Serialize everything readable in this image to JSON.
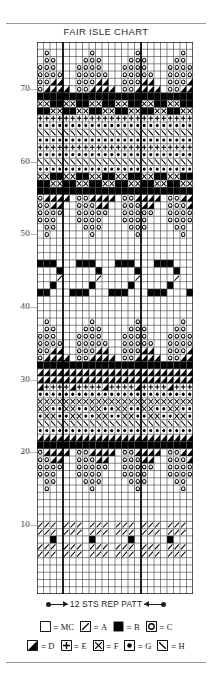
{
  "chart_title": "FAIR ISLE CHART",
  "repeat": {
    "label": "12 STS REP PATT",
    "stitches": 12,
    "marker_columns": [
      4,
      16
    ]
  },
  "grid": {
    "columns": 24,
    "rows": 76,
    "row_labels": [
      "10",
      "20",
      "30",
      "40",
      "50",
      "60",
      "70"
    ],
    "row_label_rows": [
      10,
      20,
      30,
      40,
      50,
      60,
      70
    ]
  },
  "legend": {
    "row1": [
      {
        "symbol": "blank",
        "label": "MC"
      },
      {
        "symbol": "slash",
        "label": "A"
      },
      {
        "symbol": "filled",
        "label": "B"
      },
      {
        "symbol": "circle",
        "label": "C"
      }
    ],
    "row2": [
      {
        "symbol": "halftri",
        "label": "D"
      },
      {
        "symbol": "plus",
        "label": "E"
      },
      {
        "symbol": "cross",
        "label": "F"
      },
      {
        "symbol": "dot",
        "label": "G"
      },
      {
        "symbol": "backslash",
        "label": "H"
      }
    ],
    "equals": "="
  },
  "colors": {
    "ink": "#000000",
    "grid_line": "#444444",
    "rule": "#9a9a9a",
    "text": "#2b2b2b"
  },
  "chart_data": {
    "type": "heatmap",
    "title": "FAIR ISLE CHART",
    "xlabel": "",
    "ylabel": "",
    "symbol_key": {
      "0": "MC (blank)",
      "1": "A (slash)",
      "2": "B (filled)",
      "3": "C (circle)",
      "4": "D (half triangle)",
      "5": "E (plus)",
      "6": "F (cross)",
      "7": "G (dot)",
      "8": "H (backslash)"
    },
    "columns": 24,
    "rows": 76,
    "note": "Rows listed top (row 76) to bottom (row 1); each string is 24 cells of symbol codes.",
    "matrix": [
      "000000000000000000000000",
      "030000003000000300000030",
      "033000033300003330000330",
      "333000333300033330003333",
      "333300333330033333003333",
      "334400333440033344003334",
      "344440334444033444403344",
      "222222222222222222222222",
      "662266226622662266226622",
      "226622662266226622662266",
      "555555555555555555555555",
      "777777777777777777777777",
      "888888888888888888888888",
      "777777777777777777777777",
      "555555555555555555555555",
      "777777777777777777777777",
      "888888888888888888888888",
      "777777777777777777777777",
      "662266226622662266226622",
      "226622662266226622662266",
      "222222222222222222222222",
      "344440334444033444403344",
      "334400333440033344003334",
      "333300333330033333003333",
      "333000333300033330003333",
      "033000033300003330000330",
      "030000003000000300000030",
      "000000000000000000000000",
      "000000000000000000000000",
      "000000000000000000000000",
      "222000222000222000222000",
      "000200000200000200000200",
      "000100000100000100000100",
      "002000002000002000002000",
      "220002220002220002220002",
      "000000000000000000000000",
      "000000000000000000000000",
      "000000000000000000000000",
      "030000003000000300000030",
      "033000033300003330000330",
      "333000333300033330003333",
      "333300333330033333003333",
      "334400333440033344003334",
      "344440334444033444403344",
      "222222222222222222222222",
      "444444444444444444444444",
      "444444444444444444444444",
      "455554555545555455554555",
      "777777777777777777777777",
      "666666666666666666666666",
      "667766776677667766776677",
      "766776677667766776677667",
      "888888888888888888888888",
      "777777777777777777777777",
      "444444444444444444444444",
      "222222222222222222222222",
      "344440334444033444403344",
      "334400333440033344003334",
      "333300333330033333003333",
      "333000333300033330003333",
      "033000033300003330000330",
      "030000003000000300000030",
      "000000000000000000000000",
      "000000000000000000000000",
      "000000000000000000000000",
      "000000000000000000000000",
      "111011101110111011101110",
      "111011101110111011101110",
      "002000002000002000002000",
      "111011101110111011101110",
      "111011101110111011101110",
      "000000000000000000000000",
      "000000000000000000000000",
      "000000000000000000000000",
      "000000000000000000000000",
      "000000000000000000000000",
      "000000000000000000000000",
      "000000000000000000000000"
    ]
  }
}
